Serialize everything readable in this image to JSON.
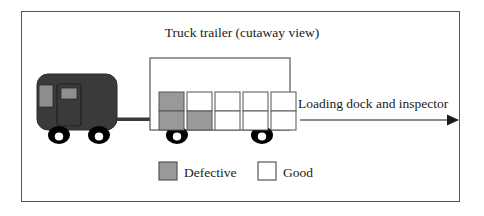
{
  "figure": {
    "title": "Truck trailer (cutaway view)",
    "annotation": "Loading dock and inspector",
    "border_color": "#555555",
    "background": "#ffffff"
  },
  "colors": {
    "cab_body": "#3a3a3a",
    "cab_window": "#8e8e8e",
    "defective_fill": "#999999",
    "good_fill": "#ffffff",
    "box_outline": "#555555",
    "wheel": "#000000",
    "wheel_hub": "#ffffff",
    "line": "#1a1a1a",
    "text": "#1a1a1a"
  },
  "truck": {
    "cab_name": "truck-cab",
    "trailer_name": "truck-trailer",
    "wheels": 4,
    "windows": 2
  },
  "cargo": {
    "columns": 5,
    "rows": 2,
    "grid": [
      [
        "defective",
        "defective"
      ],
      [
        "good",
        "defective"
      ],
      [
        "good",
        "good"
      ],
      [
        "good",
        "good"
      ],
      [
        "good",
        "good"
      ]
    ],
    "defective_count": 3,
    "good_count": 7,
    "total_count": 10
  },
  "legend": {
    "items": [
      {
        "label": "Defective",
        "swatch": "defective",
        "fill": "#999999"
      },
      {
        "label": "Good",
        "swatch": "good",
        "fill": "#ffffff"
      }
    ]
  },
  "arrow": {
    "label": "Loading dock and inspector",
    "direction": "right"
  }
}
